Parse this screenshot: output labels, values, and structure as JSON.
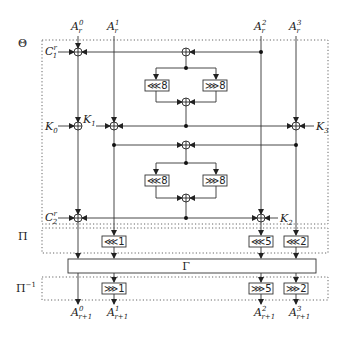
{
  "diagram": {
    "type": "block-cipher-round-function",
    "sections": [
      {
        "id": "theta",
        "label": "Θ"
      },
      {
        "id": "pi",
        "label": "Π"
      },
      {
        "id": "pi_inv",
        "label": "Π",
        "superscript": "−1"
      }
    ],
    "inputs": [
      {
        "base": "A",
        "sub": "r",
        "sup": "0"
      },
      {
        "base": "A",
        "sub": "r",
        "sup": "1"
      },
      {
        "base": "A",
        "sub": "r",
        "sup": "2"
      },
      {
        "base": "A",
        "sub": "r",
        "sup": "3"
      }
    ],
    "outputs": [
      {
        "base": "A",
        "sub": "r+1",
        "sup": "0"
      },
      {
        "base": "A",
        "sub": "r+1",
        "sup": "1"
      },
      {
        "base": "A",
        "sub": "r+1",
        "sup": "2"
      },
      {
        "base": "A",
        "sub": "r+1",
        "sup": "3"
      }
    ],
    "constants": [
      {
        "base": "C",
        "sub": "1",
        "sup": "r"
      },
      {
        "base": "C",
        "sub": "2",
        "sup": "r"
      }
    ],
    "keys": [
      {
        "base": "K",
        "sub": "0"
      },
      {
        "base": "K",
        "sub": "1"
      },
      {
        "base": "K",
        "sub": "2"
      },
      {
        "base": "K",
        "sub": "3"
      }
    ],
    "theta_rotations": {
      "upper_left": {
        "op": "⋘",
        "amount": "8"
      },
      "upper_right": {
        "op": "⋙",
        "amount": "8"
      },
      "lower_left": {
        "op": "⋘",
        "amount": "8"
      },
      "lower_right": {
        "op": "⋙",
        "amount": "8"
      }
    },
    "pi_rotations": [
      {
        "col": 1,
        "op": "⋘",
        "amount": "1"
      },
      {
        "col": 2,
        "op": "⋘",
        "amount": "5"
      },
      {
        "col": 3,
        "op": "⋘",
        "amount": "2"
      }
    ],
    "gamma": {
      "label": "Γ"
    },
    "pi_inv_rotations": [
      {
        "col": 1,
        "op": "⋙",
        "amount": "1"
      },
      {
        "col": 2,
        "op": "⋙",
        "amount": "5"
      },
      {
        "col": 3,
        "op": "⋙",
        "amount": "2"
      }
    ]
  }
}
